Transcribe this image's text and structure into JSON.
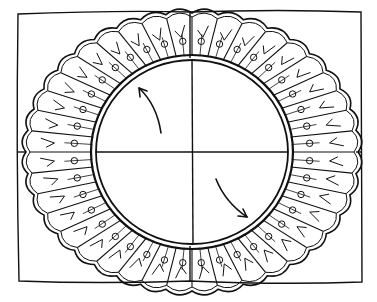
{
  "figure": {
    "type": "line-drawing",
    "colors": {
      "stroke": "#111111",
      "background": "#ffffff"
    },
    "center": [
      192,
      152
    ],
    "inner_circle": {
      "rx": 96,
      "ry": 92
    },
    "ring": {
      "inner_rx": 100,
      "inner_ry": 96,
      "outer_rx": 166,
      "outer_ry": 139,
      "scallop_count": 40
    },
    "frame": {
      "x1": 17,
      "y1": 12,
      "x2": 362,
      "y2": 282
    },
    "arrows": [
      {
        "name": "arrow-upper-left",
        "direction": "counterclockwise"
      },
      {
        "name": "arrow-lower-right",
        "direction": "clockwise"
      }
    ]
  }
}
